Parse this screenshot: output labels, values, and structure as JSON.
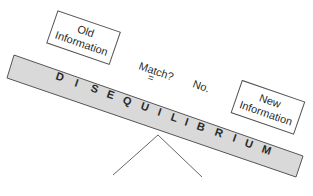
{
  "diagram": {
    "beam_label": "DISEQUILIBRIUM",
    "beam_letters": [
      "D",
      "I",
      "S",
      "E",
      "Q",
      "U",
      "I",
      "L",
      "I",
      "B",
      "R",
      "I",
      "U",
      "M"
    ],
    "left_box": {
      "line1": "Old",
      "line2": "Information"
    },
    "right_box": {
      "line1": "New",
      "line2": "Information"
    },
    "match_label": "Match?",
    "equals_sign": "=",
    "answer_label": "No.",
    "colors": {
      "beam_fill": "#d9d9d9",
      "stroke": "#555555",
      "text": "#2a2a2a",
      "background": "#ffffff"
    }
  }
}
